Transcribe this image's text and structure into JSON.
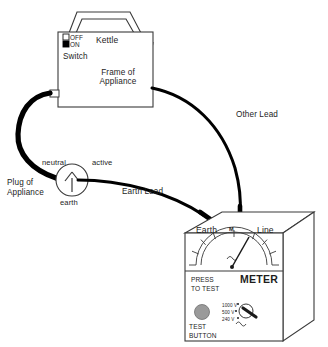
{
  "diagram": {
    "colors": {
      "outline": "#3a3a3a",
      "cord": "#000000",
      "text": "#1d1d1d",
      "button_fill": "#9a9a9a",
      "switch_on_fill": "#000000",
      "switch_off_fill": "#ffffff",
      "background": "#ffffff"
    }
  },
  "appliance": {
    "name_label": "Kettle",
    "frame_label": "Frame of\nAppliance",
    "switch": {
      "caption": "Switch",
      "off_label": "OFF",
      "on_label": "ON",
      "selected": "ON"
    }
  },
  "plug": {
    "caption": "Plug of\nAppliance",
    "pins": {
      "neutral": "neutral",
      "active": "active",
      "earth": "earth"
    }
  },
  "leads": {
    "other_lead": "Other Lead",
    "earth_lead": "Earth Lead"
  },
  "meter": {
    "brand_label": "METER",
    "terminals": {
      "earth": "Earth",
      "line": "Line"
    },
    "unit_symbol": "M",
    "press_to_test": "PRESS\nTO TEST",
    "test_button_label": "TEST\nBUTTON",
    "voltage_selector": {
      "options": [
        "1000 V",
        "500 V",
        "240 V"
      ],
      "selected": "500 V"
    }
  }
}
